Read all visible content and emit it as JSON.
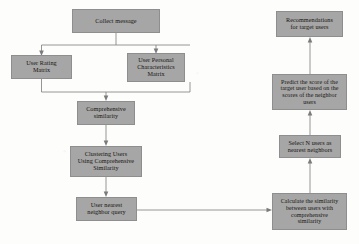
{
  "diagram": {
    "palette": {
      "node_fill": "#a6a6a6",
      "node_border": "#8e8e8e",
      "connector": "#7b7b7b",
      "background": "#fdfdfc",
      "text": "#16140f"
    },
    "nodes": [
      {
        "id": "collect-message",
        "label": "Collect message",
        "x": 72,
        "y": 9,
        "w": 88,
        "h": 24,
        "font_size": 6.2
      },
      {
        "id": "user-rating-matrix",
        "label": "User Rating\nMatrix",
        "x": 11,
        "y": 55,
        "w": 61,
        "h": 24,
        "font_size": 6.2
      },
      {
        "id": "user-personal-characteristics-matrix",
        "label": "User Personal\nCharacteristics\nMatrix",
        "x": 127,
        "y": 53,
        "w": 58,
        "h": 29,
        "font_size": 6.2
      },
      {
        "id": "comprehensive-similarity",
        "label": "Comprehensive\nsimilarity",
        "x": 77,
        "y": 101,
        "w": 58,
        "h": 24,
        "font_size": 6.2
      },
      {
        "id": "clustering-users",
        "label": "Clustering Users\nUsing Comprehensive\nSimilarity",
        "x": 70,
        "y": 146,
        "w": 72,
        "h": 31,
        "font_size": 6.2
      },
      {
        "id": "user-nearest-neighbor-query",
        "label": "User nearest\nneighbor query",
        "x": 76,
        "y": 197,
        "w": 61,
        "h": 24,
        "font_size": 6.2
      },
      {
        "id": "recommendations-for-target-users",
        "label": "Recommendations\nfor target users",
        "x": 276,
        "y": 11,
        "w": 67,
        "h": 26,
        "font_size": 6.2
      },
      {
        "id": "predict-score",
        "label": "Predict the score of the\ntarget user based on the\nscores of the neighbor\nusers",
        "x": 272,
        "y": 74,
        "w": 75,
        "h": 36,
        "font_size": 6.0
      },
      {
        "id": "select-n-users",
        "label": "Select N users as\nnearest neighbors",
        "x": 279,
        "y": 135,
        "w": 62,
        "h": 23,
        "font_size": 6.2
      },
      {
        "id": "calculate-similarity",
        "label": "Calculate the similarity\nbetween users with\ncomprehensive\nsimilarity",
        "x": 272,
        "y": 193,
        "w": 75,
        "h": 37,
        "font_size": 6.0
      }
    ],
    "edges": [
      {
        "id": "collect-to-rating",
        "from": "collect-message",
        "to": "user-rating-matrix",
        "style": "orthogonal-split-left"
      },
      {
        "id": "collect-to-personal",
        "from": "collect-message",
        "to": "user-personal-characteristics-matrix",
        "style": "orthogonal-split-right"
      },
      {
        "id": "rating-to-comprehensive",
        "from": "user-rating-matrix",
        "to": "comprehensive-similarity",
        "style": "orthogonal-merge-left"
      },
      {
        "id": "personal-to-comprehensive",
        "from": "user-personal-characteristics-matrix",
        "to": "comprehensive-similarity",
        "style": "orthogonal-merge-right"
      },
      {
        "id": "comprehensive-to-clustering",
        "from": "comprehensive-similarity",
        "to": "clustering-users",
        "style": "vertical-down"
      },
      {
        "id": "clustering-to-query",
        "from": "clustering-users",
        "to": "user-nearest-neighbor-query",
        "style": "vertical-down"
      },
      {
        "id": "query-to-calculate",
        "from": "user-nearest-neighbor-query",
        "to": "calculate-similarity",
        "style": "horizontal-right"
      },
      {
        "id": "calculate-to-select",
        "from": "calculate-similarity",
        "to": "select-n-users",
        "style": "vertical-up"
      },
      {
        "id": "select-to-predict",
        "from": "select-n-users",
        "to": "predict-score",
        "style": "vertical-up"
      },
      {
        "id": "predict-to-recommendations",
        "from": "predict-score",
        "to": "recommendations-for-target-users",
        "style": "vertical-up"
      }
    ]
  }
}
